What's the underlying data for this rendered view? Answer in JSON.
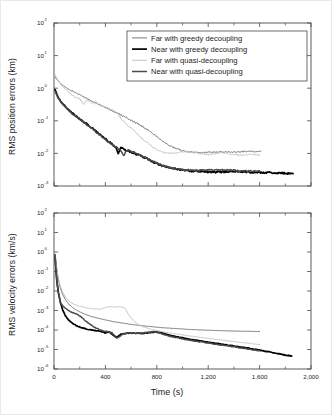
{
  "figure": {
    "name": "rms-error-convergence-figure",
    "background": "#ffffff"
  },
  "series_styles": {
    "far_greedy": {
      "color": "#6b6b6b",
      "width": 0.9
    },
    "near_greedy": {
      "color": "#000000",
      "width": 1.7
    },
    "far_quasi": {
      "color": "#bdbdbd",
      "width": 0.9
    },
    "near_quasi": {
      "color": "#4a4a4a",
      "width": 1.5
    }
  },
  "legend": {
    "name": "chart-legend",
    "position": "upper-right-inside-top-panel",
    "entries": [
      {
        "label": "Far with greedy decoupling",
        "color": "#6b6b6b",
        "width": 0.9
      },
      {
        "label": "Near with greedy decoupling",
        "color": "#000000",
        "width": 1.7
      },
      {
        "label": "Far with quasi-decoupling",
        "color": "#bdbdbd",
        "width": 0.9
      },
      {
        "label": "Near with quasi-decoupling",
        "color": "#4a4a4a",
        "width": 1.5
      }
    ]
  },
  "chart_data": [
    {
      "id": "position-errors",
      "type": "line",
      "title": "",
      "xlabel": "",
      "ylabel": "RMS position errors (km)",
      "yscale": "log",
      "xlim": [
        0,
        2000
      ],
      "ylim": [
        0.001,
        100
      ],
      "grid": false,
      "xticks": [
        0,
        400,
        800,
        1200,
        1600,
        2000
      ],
      "xticklabels": [
        "0",
        "400",
        "800",
        "1,200",
        "1,600",
        "2,000"
      ],
      "xticks_minor": [
        200,
        600,
        1000,
        1400,
        1800
      ],
      "yticks": [
        0.001,
        0.01,
        0.1,
        1,
        10,
        100
      ],
      "yticklabels": [
        "10⁻³",
        "10⁻²",
        "10⁻¹",
        "10⁰",
        "10¹",
        "10²"
      ],
      "ytick_bases": [
        "10",
        "10",
        "10",
        "10",
        "10",
        "10"
      ],
      "ytick_exps": [
        "-3",
        "-2",
        "-1",
        "0",
        "1",
        "2"
      ],
      "series": [
        {
          "name": "Far with greedy decoupling",
          "color": "#6b6b6b",
          "x": [
            8,
            20,
            40,
            60,
            85,
            110,
            140,
            170,
            200,
            230,
            260,
            300,
            340,
            380,
            420,
            460,
            500,
            540,
            580,
            620,
            660,
            700,
            740,
            780,
            820,
            860,
            900,
            940,
            980,
            1020,
            1060,
            1100,
            1150,
            1200,
            1260,
            1320,
            1380,
            1440,
            1500,
            1560,
            1610
          ],
          "y": [
            2.2,
            1.9,
            1.55,
            1.3,
            1.1,
            0.95,
            0.82,
            0.72,
            0.62,
            0.55,
            0.48,
            0.4,
            0.34,
            0.28,
            0.235,
            0.195,
            0.165,
            0.138,
            0.115,
            0.095,
            0.078,
            0.062,
            0.049,
            0.038,
            0.029,
            0.022,
            0.017,
            0.0145,
            0.0128,
            0.0118,
            0.0112,
            0.0108,
            0.0106,
            0.0107,
            0.011,
            0.0112,
            0.011,
            0.0112,
            0.0115,
            0.0117,
            0.0118
          ]
        },
        {
          "name": "Near with greedy decoupling",
          "color": "#000000",
          "x": [
            8,
            18,
            30,
            45,
            60,
            80,
            100,
            120,
            140,
            165,
            190,
            215,
            240,
            270,
            300,
            330,
            360,
            390,
            420,
            450,
            480,
            500,
            520,
            560,
            600,
            640,
            680,
            720,
            760,
            800,
            840,
            880,
            920,
            960,
            1000,
            1060,
            1120,
            1180,
            1240,
            1300,
            1360,
            1420,
            1480,
            1540,
            1600,
            1660,
            1720,
            1780,
            1840,
            1860
          ],
          "y": [
            0.92,
            0.72,
            0.55,
            0.44,
            0.36,
            0.3,
            0.245,
            0.205,
            0.175,
            0.145,
            0.122,
            0.105,
            0.088,
            0.072,
            0.058,
            0.046,
            0.038,
            0.03,
            0.024,
            0.0195,
            0.016,
            0.0098,
            0.015,
            0.0128,
            0.011,
            0.0095,
            0.0082,
            0.007,
            0.0058,
            0.0048,
            0.0042,
            0.0038,
            0.0035,
            0.0033,
            0.0031,
            0.0029,
            0.0028,
            0.0027,
            0.00265,
            0.0027,
            0.0028,
            0.0028,
            0.0027,
            0.0026,
            0.0026,
            0.0026,
            0.0025,
            0.0025,
            0.0024,
            0.0024
          ]
        },
        {
          "name": "Far with quasi-decoupling",
          "color": "#bdbdbd",
          "x": [
            8,
            20,
            40,
            60,
            85,
            110,
            140,
            170,
            200,
            215,
            230,
            245,
            260,
            280,
            300,
            330,
            360,
            400,
            440,
            470,
            490,
            510,
            530,
            560,
            590,
            620,
            650,
            680,
            710,
            740,
            770,
            800,
            830,
            860,
            890,
            920,
            960,
            1000,
            1050,
            1100,
            1150,
            1200,
            1250,
            1300,
            1350,
            1400,
            1450,
            1500,
            1550,
            1600
          ],
          "y": [
            2.6,
            2.1,
            1.55,
            1.2,
            0.95,
            0.78,
            0.63,
            0.53,
            0.46,
            0.4,
            0.3,
            0.4,
            0.42,
            0.38,
            0.36,
            0.33,
            0.3,
            0.26,
            0.22,
            0.2,
            0.175,
            0.135,
            0.105,
            0.082,
            0.065,
            0.05,
            0.038,
            0.03,
            0.024,
            0.019,
            0.0155,
            0.013,
            0.0115,
            0.0105,
            0.0102,
            0.01,
            0.0104,
            0.011,
            0.0113,
            0.0105,
            0.0096,
            0.0092,
            0.0098,
            0.0105,
            0.01,
            0.0092,
            0.0089,
            0.0091,
            0.0094,
            0.009
          ]
        },
        {
          "name": "Near with quasi-decoupling",
          "color": "#4a4a4a",
          "x": [
            8,
            18,
            30,
            45,
            60,
            80,
            100,
            120,
            140,
            165,
            190,
            215,
            240,
            270,
            300,
            330,
            360,
            390,
            420,
            450,
            480,
            510,
            545,
            560,
            580,
            620,
            660,
            700,
            740,
            780,
            820,
            860,
            900,
            940,
            980,
            1040,
            1100,
            1160,
            1220,
            1280,
            1340,
            1400,
            1460,
            1520,
            1580,
            1600
          ],
          "y": [
            0.8,
            0.66,
            0.52,
            0.42,
            0.345,
            0.285,
            0.235,
            0.198,
            0.168,
            0.14,
            0.118,
            0.1,
            0.085,
            0.07,
            0.056,
            0.045,
            0.036,
            0.029,
            0.0235,
            0.019,
            0.0158,
            0.0135,
            0.0088,
            0.0118,
            0.0125,
            0.0108,
            0.0092,
            0.0079,
            0.0066,
            0.0054,
            0.0046,
            0.0041,
            0.0037,
            0.0034,
            0.0032,
            0.0031,
            0.003,
            0.003,
            0.0031,
            0.0032,
            0.0031,
            0.003,
            0.0029,
            0.0029,
            0.0029,
            0.0029
          ]
        }
      ]
    },
    {
      "id": "velocity-errors",
      "type": "line",
      "title": "",
      "xlabel": "Time (s)",
      "ylabel": "RMS velocity errors (km/s)",
      "yscale": "log",
      "xlim": [
        0,
        2000
      ],
      "ylim": [
        1e-06,
        100
      ],
      "grid": false,
      "xticks": [
        0,
        400,
        800,
        1200,
        1600,
        2000
      ],
      "xticklabels": [
        "0",
        "400",
        "800",
        "1,200",
        "1,600",
        "2,000"
      ],
      "xticks_minor": [
        200,
        600,
        1000,
        1400,
        1800
      ],
      "yticks": [
        1e-06,
        1e-05,
        0.0001,
        0.001,
        0.01,
        0.1,
        1,
        10,
        100
      ],
      "yticklabels": [
        "10⁻⁶",
        "10⁻⁵",
        "10⁻⁴",
        "10⁻³",
        "10⁻²",
        "10⁻¹",
        "10⁰",
        "10¹",
        "10²"
      ],
      "ytick_bases": [
        "10",
        "10",
        "10",
        "10",
        "10",
        "10",
        "10",
        "10",
        "10"
      ],
      "ytick_exps": [
        "-6",
        "-5",
        "-4",
        "-3",
        "-2",
        "-1",
        "0",
        "1",
        "2"
      ],
      "series": [
        {
          "name": "Far with greedy decoupling",
          "color": "#6b6b6b",
          "x": [
            8,
            16,
            28,
            45,
            65,
            90,
            120,
            155,
            195,
            240,
            290,
            345,
            400,
            460,
            520,
            580,
            640,
            700,
            760,
            820,
            880,
            940,
            1000,
            1070,
            1140,
            1210,
            1280,
            1350,
            1420,
            1490,
            1560,
            1600
          ],
          "y": [
            0.75,
            0.23,
            0.062,
            0.018,
            0.0072,
            0.0035,
            0.00195,
            0.00125,
            0.00088,
            0.00065,
            0.0005,
            0.0004,
            0.00033,
            0.00027,
            0.000232,
            0.000203,
            0.00018,
            0.000162,
            0.000148,
            0.000136,
            0.000127,
            0.000119,
            0.000113,
            0.000106,
            0.000101,
            9.7e-05,
            9.35e-05,
            9.05e-05,
            8.8e-05,
            8.6e-05,
            8.45e-05,
            8.4e-05
          ]
        },
        {
          "name": "Near with greedy decoupling",
          "color": "#000000",
          "x": [
            8,
            14,
            22,
            34,
            50,
            68,
            90,
            115,
            145,
            180,
            220,
            262,
            305,
            345,
            375,
            400,
            420,
            440,
            460,
            480,
            500,
            520,
            545,
            570,
            600,
            640,
            680,
            720,
            760,
            800,
            830,
            860,
            900,
            940,
            980,
            1030,
            1080,
            1140,
            1200,
            1260,
            1320,
            1380,
            1440,
            1500,
            1560,
            1620,
            1680,
            1740,
            1800,
            1850
          ],
          "y": [
            0.72,
            0.16,
            0.034,
            0.0085,
            0.0026,
            0.00105,
            0.00052,
            0.000315,
            0.000215,
            0.00016,
            0.000128,
            0.000108,
            9.55e-05,
            9e-05,
            8e-05,
            7.2e-05,
            8e-05,
            7.2e-05,
            5.6e-05,
            4.3e-05,
            4.8e-05,
            6e-05,
            6.6e-05,
            6.9e-05,
            7e-05,
            6.8e-05,
            6.6e-05,
            7e-05,
            7.6e-05,
            8e-05,
            7.4e-05,
            6.4e-05,
            5.4e-05,
            4.7e-05,
            4.2e-05,
            3.6e-05,
            3.15e-05,
            2.72e-05,
            2.35e-05,
            2.05e-05,
            1.8e-05,
            1.58e-05,
            1.38e-05,
            1.2e-05,
            1.03e-05,
            8.8e-06,
            7.4e-06,
            6.2e-06,
            5.2e-06,
            4.6e-06
          ]
        },
        {
          "name": "Far with quasi-decoupling",
          "color": "#bdbdbd",
          "x": [
            8,
            16,
            28,
            45,
            65,
            90,
            120,
            155,
            195,
            235,
            275,
            315,
            355,
            390,
            410,
            430,
            450,
            470,
            490,
            510,
            530,
            550,
            565,
            580,
            600,
            630,
            660,
            700,
            745,
            790,
            840,
            890,
            940,
            990,
            1040,
            1090,
            1140,
            1200,
            1260,
            1320,
            1380,
            1440,
            1500,
            1560,
            1600
          ],
          "y": [
            0.78,
            0.26,
            0.075,
            0.022,
            0.0092,
            0.0047,
            0.0029,
            0.0021,
            0.00168,
            0.00145,
            0.00128,
            0.00122,
            0.00118,
            0.0013,
            0.00148,
            0.0016,
            0.00155,
            0.00148,
            0.00152,
            0.00158,
            0.0015,
            0.0013,
            0.00098,
            0.00062,
            0.00042,
            0.000255,
            0.000185,
            0.00014,
            0.000112,
            9.5e-05,
            8.2e-05,
            7.2e-05,
            6.4e-05,
            5.7e-05,
            5.1e-05,
            4.6e-05,
            4.15e-05,
            3.7e-05,
            3.3e-05,
            2.95e-05,
            2.65e-05,
            2.38e-05,
            2.15e-05,
            1.92e-05,
            1.78e-05
          ]
        },
        {
          "name": "Near with quasi-decoupling",
          "color": "#4a4a4a",
          "x": [
            8,
            14,
            22,
            34,
            50,
            68,
            90,
            115,
            145,
            180,
            215,
            250,
            285,
            320,
            350,
            375,
            400,
            425,
            450,
            470,
            490,
            510,
            530,
            555,
            580,
            615,
            650,
            690,
            730,
            770,
            800,
            830,
            865,
            900,
            940,
            985,
            1035,
            1090,
            1150,
            1210,
            1270,
            1330,
            1390,
            1450,
            1510,
            1570,
            1600
          ],
          "y": [
            0.7,
            0.155,
            0.033,
            0.0082,
            0.0025,
            0.00175,
            0.00128,
            0.00098,
            0.00078,
            0.00064,
            0.00045,
            0.00028,
            0.000185,
            0.000135,
            0.000108,
            9.3e-05,
            8.6e-05,
            7.9e-05,
            7.3e-05,
            5.2e-05,
            3.9e-05,
            4.5e-05,
            6e-05,
            6.7e-05,
            7e-05,
            6.9e-05,
            6.7e-05,
            7.1e-05,
            7.7e-05,
            8.1e-05,
            7.6e-05,
            6.6e-05,
            5.6e-05,
            4.8e-05,
            4.25e-05,
            3.65e-05,
            3.18e-05,
            2.75e-05,
            2.38e-05,
            2.08e-05,
            1.82e-05,
            1.6e-05,
            1.4e-05,
            1.22e-05,
            1.06e-05,
            9.2e-06,
            8.6e-06
          ]
        }
      ]
    }
  ]
}
